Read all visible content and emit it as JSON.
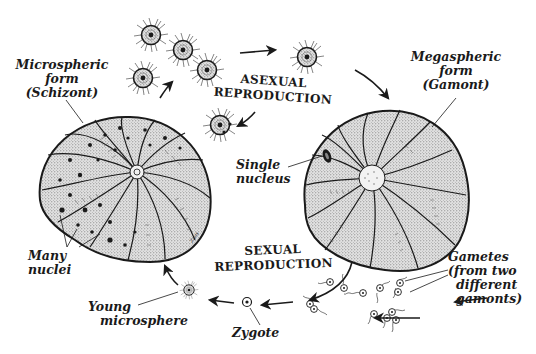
{
  "diagram": {
    "colors": {
      "ink": "#1a1a1a",
      "shell_fill": "#cfcfcf",
      "shell_dark": "#9a9a9a",
      "background": "#ffffff"
    },
    "labels": {
      "microspheric": {
        "line1": "Microspheric",
        "line2": "form",
        "line3": "(Schizont)"
      },
      "megaspheric": {
        "line1": "Megaspheric",
        "line2": "form",
        "line3": "(Gamont)"
      },
      "asexual": {
        "line1": "ASEXUAL",
        "line2": "REPRODUCTION"
      },
      "sexual": {
        "line1": "SEXUAL",
        "line2": "REPRODUCTION"
      },
      "single_nucleus": {
        "line1": "Single",
        "line2": "nucleus"
      },
      "many_nuclei": {
        "line1": "Many",
        "line2": "nuclei"
      },
      "gametes": {
        "line1": "Gametes",
        "line2": "(from two",
        "line3": "different",
        "line4": "gamonts)"
      },
      "zygote": "Zygote",
      "young_microsphere": {
        "line1": "Young",
        "line2": "microsphere"
      },
      "signature": "Zaas"
    },
    "stages": [
      "Microspheric form (Schizont)",
      "Asexual reproduction (juveniles released)",
      "Megaspheric form (Gamont)",
      "Gametes (from two different gamonts)",
      "Zygote",
      "Young microsphere"
    ]
  }
}
